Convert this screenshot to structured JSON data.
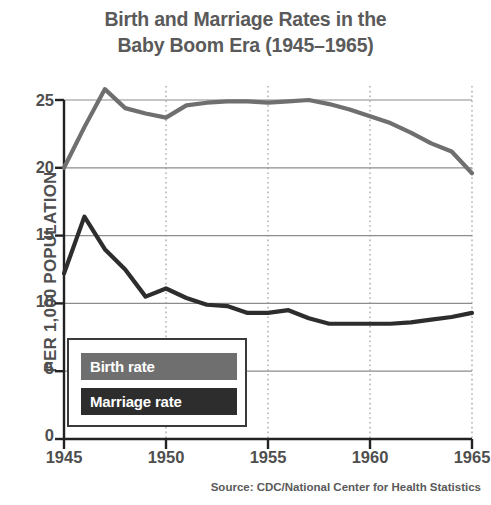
{
  "chart_data": {
    "type": "line",
    "title": "Birth and Marriage Rates in the Baby Boom Era (1945–1965)",
    "title_lines": [
      "Birth and Marriage Rates in the",
      "Baby Boom Era (1945–1965)"
    ],
    "xlabel": "",
    "ylabel": "PER 1,000 POPULATION",
    "source": "Source: CDC/National Center for Health Statistics",
    "xlim": [
      1945,
      1965
    ],
    "ylim": [
      0,
      25
    ],
    "yticks": [
      0,
      5,
      10,
      15,
      20,
      25
    ],
    "ytick_labels": [
      "0",
      "5",
      "10",
      "15",
      "20",
      "25"
    ],
    "xticks": [
      1945,
      1950,
      1955,
      1960,
      1965
    ],
    "xtick_labels": [
      "1945",
      "1950",
      "1955",
      "1960",
      "1965"
    ],
    "grid": "horizontal solid gridlines at y ticks; vertical dotted gridlines at x ticks",
    "legend_position": "inside lower left",
    "x": [
      1945,
      1946,
      1947,
      1948,
      1949,
      1950,
      1951,
      1952,
      1953,
      1954,
      1955,
      1956,
      1957,
      1958,
      1959,
      1960,
      1961,
      1962,
      1963,
      1964,
      1965
    ],
    "series": [
      {
        "name": "Birth rate",
        "color": "#6f6f6f",
        "values": [
          20.0,
          23.0,
          25.8,
          24.4,
          24.0,
          23.7,
          24.6,
          24.8,
          24.9,
          24.9,
          24.8,
          24.9,
          25.0,
          24.7,
          24.3,
          23.8,
          23.3,
          22.6,
          21.8,
          21.2,
          19.6
        ]
      },
      {
        "name": "Marriage rate",
        "color": "#2d2d2d",
        "values": [
          12.2,
          16.4,
          14.0,
          12.5,
          10.5,
          11.1,
          10.4,
          9.9,
          9.8,
          9.3,
          9.3,
          9.5,
          8.9,
          8.5,
          8.5,
          8.5,
          8.5,
          8.6,
          8.8,
          9.0,
          9.3
        ]
      }
    ]
  },
  "legend": {
    "items": [
      {
        "label": "Birth rate",
        "color": "#6f6f6f"
      },
      {
        "label": "Marriage rate",
        "color": "#2d2d2d"
      }
    ]
  },
  "axes": {
    "y_tick_0": "0",
    "y_tick_5": "5",
    "y_tick_10": "10",
    "y_tick_15": "15",
    "y_tick_20": "20",
    "y_tick_25": "25",
    "x_tick_1945": "1945",
    "x_tick_1950": "1950",
    "x_tick_1955": "1955",
    "x_tick_1960": "1960",
    "x_tick_1965": "1965"
  }
}
